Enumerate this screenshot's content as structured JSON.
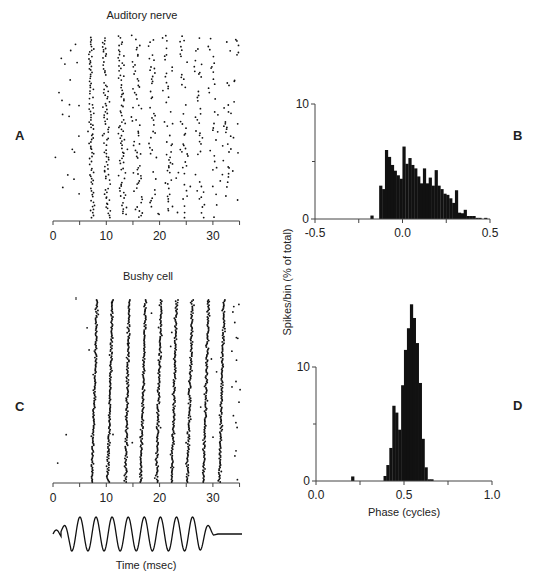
{
  "figure": {
    "panel_letters": {
      "A": "A",
      "B": "B",
      "C": "C",
      "D": "D"
    },
    "y_axis_label_shared": "Spikes/bin (% of total)",
    "x_axis_label_time": "Time (msec)",
    "x_axis_label_phase": "Phase (cycles)"
  },
  "chart_data": [
    {
      "id": "A",
      "type": "scatter",
      "title": "Auditory nerve",
      "xlabel": "Time (msec)",
      "ylabel": "",
      "xlim": [
        0,
        35
      ],
      "xticks": [
        0,
        10,
        20,
        30
      ],
      "xtick_labels": [
        "0",
        "10",
        "20",
        "30"
      ],
      "minor_xticks": [
        5,
        15,
        25,
        35
      ],
      "grid": false,
      "description": "Raster plot of spike times; dots cluster into 10 phase-locked vertical bands starting ~7 ms, spaced ~2.9 ms apart, with looser locking and sparser dots at later times plus scattered spontaneous spikes",
      "band_centers_ms": [
        7.5,
        10.3,
        13.2,
        16.1,
        19.0,
        21.9,
        24.8,
        27.7,
        30.5,
        33.0
      ],
      "band_jitter_ms": [
        0.6,
        0.7,
        0.8,
        0.9,
        0.9,
        1.0,
        1.0,
        1.0,
        1.0,
        1.0
      ],
      "band_density": [
        1.0,
        1.0,
        0.95,
        0.8,
        0.6,
        0.55,
        0.5,
        0.45,
        0.45,
        0.3
      ],
      "spontaneous_spike_count": 35
    },
    {
      "id": "B",
      "type": "bar",
      "title": "",
      "xlabel": "",
      "ylabel": "Spikes/bin (% of total)",
      "xlim": [
        -0.5,
        0.5
      ],
      "ylim": [
        0,
        10
      ],
      "xticks": [
        -0.5,
        0.0,
        0.5
      ],
      "xtick_labels": [
        "-0.5",
        "0.0",
        "0.5"
      ],
      "minor_xticks": [
        -0.25,
        0.25
      ],
      "yticks": [
        0,
        10
      ],
      "ytick_labels": [
        "0",
        "10"
      ],
      "minor_yticks": [
        5
      ],
      "bin_width": 0.0167,
      "x": [
        -0.175,
        -0.158,
        -0.142,
        -0.125,
        -0.108,
        -0.092,
        -0.075,
        -0.058,
        -0.042,
        -0.025,
        -0.008,
        0.008,
        0.025,
        0.042,
        0.058,
        0.075,
        0.092,
        0.108,
        0.125,
        0.142,
        0.158,
        0.175,
        0.192,
        0.208,
        0.225,
        0.242,
        0.258,
        0.275,
        0.292,
        0.308,
        0.325,
        0.342,
        0.358,
        0.375,
        0.392,
        0.408,
        0.425,
        0.442,
        0.458,
        0.475
      ],
      "values": [
        0.3,
        0,
        0,
        2.9,
        2.6,
        6.0,
        5.4,
        4.7,
        4.2,
        3.8,
        3.5,
        6.3,
        4.8,
        5.3,
        4.7,
        4.4,
        3.7,
        3.1,
        4.4,
        3.1,
        3.6,
        2.9,
        4.25,
        2.9,
        2.6,
        2.2,
        2.1,
        1.8,
        1.4,
        2.5,
        0.55,
        0.5,
        0.8,
        0.26,
        0.26,
        0.26,
        0.1,
        0.1,
        0,
        0.1
      ]
    },
    {
      "id": "C",
      "type": "scatter",
      "title": "Bushy cell",
      "xlabel": "Time (msec)",
      "ylabel": "",
      "xlim": [
        0,
        35
      ],
      "xticks": [
        0,
        10,
        20,
        30
      ],
      "xtick_labels": [
        "0",
        "10",
        "20",
        "30"
      ],
      "minor_xticks": [
        5,
        15,
        25,
        35
      ],
      "grid": false,
      "description": "Raster plot of spike times; spikes form 9 tight, slightly slanted vertical lines (precise phase locking) with few scattered spikes, more scatter after ~33 ms",
      "line_bottom_ms": [
        7.3,
        10.3,
        13.6,
        16.4,
        19.4,
        22.3,
        25.2,
        28.2,
        31.2
      ],
      "line_top_ms": [
        8.3,
        11.1,
        14.3,
        17.4,
        20.3,
        23.2,
        26.2,
        29.2,
        32.1
      ],
      "spontaneous_spike_count": 40
    },
    {
      "id": "D",
      "type": "bar",
      "title": "",
      "xlabel": "Phase (cycles)",
      "ylabel": "Spikes/bin (% of total)",
      "xlim": [
        0.0,
        1.0
      ],
      "ylim": [
        0,
        16
      ],
      "xticks": [
        0.0,
        0.5,
        1.0
      ],
      "xtick_labels": [
        "0.0",
        "0.5",
        "1.0"
      ],
      "minor_xticks": [
        0.25,
        0.75
      ],
      "yticks": [
        0,
        10
      ],
      "ytick_labels": [
        "0",
        "10"
      ],
      "minor_yticks": [
        5
      ],
      "bin_width": 0.0167,
      "x": [
        0.208,
        0.392,
        0.408,
        0.425,
        0.442,
        0.458,
        0.475,
        0.492,
        0.508,
        0.525,
        0.542,
        0.558,
        0.575,
        0.592,
        0.608,
        0.625,
        0.642,
        0.658
      ],
      "values": [
        0.4,
        0.44,
        1.4,
        2.9,
        6.6,
        6.0,
        4.5,
        8.4,
        11.5,
        13.4,
        15.5,
        14.3,
        12.1,
        8.6,
        3.7,
        1.2,
        0.15,
        0.15
      ]
    },
    {
      "id": "stimulus",
      "type": "line",
      "title": "",
      "xlabel": "Time (msec)",
      "description": "Stimulus waveform: tone burst with 9 full cycles after a small onset bump, then flat line",
      "cycles": 9,
      "frequency_khz_approx": 0.34
    }
  ],
  "colors": {
    "ink": "#111111",
    "axis": "#444444",
    "text": "#222222",
    "background": "#ffffff"
  }
}
